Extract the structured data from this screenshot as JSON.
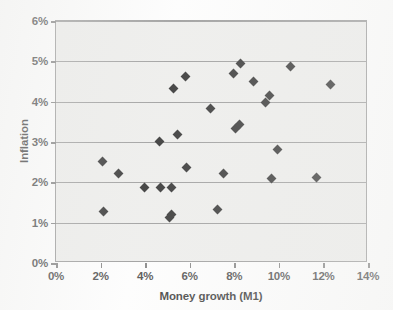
{
  "chart_data": {
    "type": "scatter",
    "title": "",
    "xlabel": "Money growth (M1)",
    "ylabel": "Inflation",
    "xlim": [
      0,
      14
    ],
    "ylim": [
      0,
      6
    ],
    "xtick_labels": [
      "0%",
      "2%",
      "4%",
      "6%",
      "8%",
      "10%",
      "12%",
      "14%"
    ],
    "xticks": [
      0,
      2,
      4,
      6,
      8,
      10,
      12,
      14
    ],
    "ytick_labels": [
      "0%",
      "1%",
      "2%",
      "3%",
      "4%",
      "5%",
      "6%"
    ],
    "yticks": [
      0,
      1,
      2,
      3,
      4,
      5,
      6
    ],
    "grid": "horizontal",
    "legend": "none",
    "marker": "filled-diamond",
    "marker_color": "#0d0d0d",
    "plot_bg_color": "#ececea",
    "axis_color": "#8a8a8a",
    "gridline_color": "#8c8c8c",
    "points": [
      {
        "x": 2.1,
        "y": 2.52
      },
      {
        "x": 2.15,
        "y": 1.27
      },
      {
        "x": 2.8,
        "y": 2.22
      },
      {
        "x": 3.95,
        "y": 1.87
      },
      {
        "x": 4.65,
        "y": 3.02
      },
      {
        "x": 4.7,
        "y": 1.88
      },
      {
        "x": 5.1,
        "y": 1.12
      },
      {
        "x": 5.2,
        "y": 1.2
      },
      {
        "x": 5.2,
        "y": 1.88
      },
      {
        "x": 5.25,
        "y": 4.32
      },
      {
        "x": 5.45,
        "y": 3.18
      },
      {
        "x": 5.8,
        "y": 4.62
      },
      {
        "x": 5.85,
        "y": 2.36
      },
      {
        "x": 6.95,
        "y": 3.84
      },
      {
        "x": 7.25,
        "y": 1.33
      },
      {
        "x": 7.5,
        "y": 2.23
      },
      {
        "x": 7.95,
        "y": 4.71
      },
      {
        "x": 8.05,
        "y": 3.34
      },
      {
        "x": 8.25,
        "y": 3.44
      },
      {
        "x": 8.3,
        "y": 4.95
      },
      {
        "x": 8.85,
        "y": 4.49
      },
      {
        "x": 9.4,
        "y": 3.97
      },
      {
        "x": 9.6,
        "y": 4.16
      },
      {
        "x": 9.65,
        "y": 2.1
      },
      {
        "x": 9.95,
        "y": 2.82
      },
      {
        "x": 10.5,
        "y": 4.88
      },
      {
        "x": 11.7,
        "y": 2.12
      },
      {
        "x": 12.3,
        "y": 4.42
      }
    ]
  }
}
